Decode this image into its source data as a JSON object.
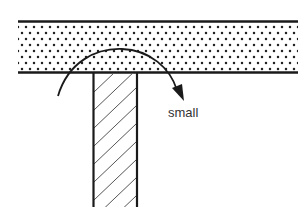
{
  "diagram": {
    "labels": {
      "moment": "small"
    },
    "colors": {
      "line": "#1a1a1a",
      "dots": "#222222",
      "hatch": "#555555",
      "background": "#ffffff",
      "text": "#333333"
    },
    "geometry": {
      "slab": {
        "x1": 18,
        "x2": 298,
        "top": 21,
        "bottom": 73
      },
      "column": {
        "left": 93,
        "right": 137,
        "top": 73,
        "bottom": 207
      },
      "arc": {
        "start": [
          58,
          96
        ],
        "peak": [
          120,
          49
        ],
        "end": [
          182,
          100
        ]
      }
    }
  }
}
